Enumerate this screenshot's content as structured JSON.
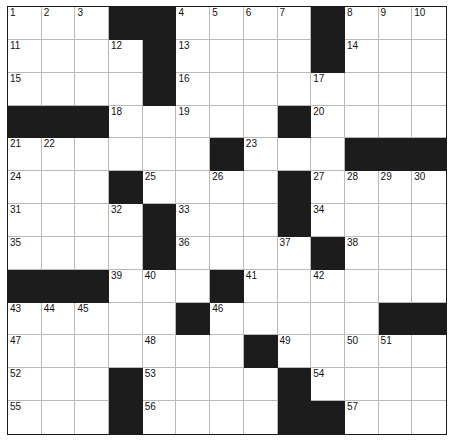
{
  "puzzle": {
    "kind": "crossword-grid",
    "title": "",
    "columns": 13,
    "rows": 13,
    "cell_colors": {
      "open": "#ffffff",
      "block": "#1c1c1c",
      "grid_line": "#b9b9b9",
      "outer_border": "#1a1a1a",
      "number_text": "#111111"
    },
    "clue_number_count": 57,
    "max_clue_number": 57,
    "grid": [
      [
        "1",
        "2",
        "3",
        "#",
        "#",
        "4",
        "5",
        "6",
        "7",
        "#",
        "8",
        "9",
        "10"
      ],
      [
        "11",
        "",
        "",
        "12",
        "#",
        "13",
        "",
        "",
        "",
        "#",
        "14",
        "",
        ""
      ],
      [
        "15",
        "",
        "",
        "",
        "#",
        "16",
        "",
        "",
        "",
        "17",
        "",
        "",
        ""
      ],
      [
        "#",
        "#",
        "#",
        "18",
        "",
        "19",
        "",
        "",
        "#",
        "20",
        "",
        "",
        ""
      ],
      [
        "21",
        "22",
        "",
        "",
        "",
        "",
        "#",
        "23",
        "",
        "",
        "#",
        "#",
        "#"
      ],
      [
        "24",
        "",
        "",
        "#",
        "25",
        "",
        "26",
        "",
        "#",
        "27",
        "28",
        "29",
        "30"
      ],
      [
        "31",
        "",
        "",
        "32",
        "#",
        "33",
        "",
        "",
        "#",
        "34",
        "",
        "",
        ""
      ],
      [
        "35",
        "",
        "",
        "",
        "#",
        "36",
        "",
        "",
        "37",
        "#",
        "38",
        "",
        ""
      ],
      [
        "#",
        "#",
        "#",
        "39",
        "40",
        "",
        "#",
        "41",
        "",
        "42",
        "",
        "",
        ""
      ],
      [
        "43",
        "44",
        "45",
        "",
        "",
        "#",
        "46",
        "",
        "",
        "",
        "",
        "#",
        "#"
      ],
      [
        "47",
        "",
        "",
        "",
        "48",
        "",
        "",
        "#",
        "49",
        "",
        "50",
        "51",
        ""
      ],
      [
        "52",
        "",
        "",
        "#",
        "53",
        "",
        "",
        "",
        "#",
        "54",
        "",
        "",
        ""
      ],
      [
        "55",
        "",
        "",
        "#",
        "56",
        "",
        "",
        "",
        "#",
        "#",
        "57",
        "",
        ""
      ]
    ],
    "numbers_in_reading_order": [
      "1",
      "2",
      "3",
      "4",
      "5",
      "6",
      "7",
      "8",
      "9",
      "10",
      "11",
      "12",
      "13",
      "14",
      "15",
      "16",
      "17",
      "18",
      "19",
      "20",
      "21",
      "22",
      "23",
      "24",
      "25",
      "26",
      "27",
      "28",
      "29",
      "30",
      "31",
      "32",
      "33",
      "34",
      "35",
      "36",
      "37",
      "38",
      "39",
      "40",
      "41",
      "42",
      "43",
      "44",
      "45",
      "46",
      "47",
      "48",
      "49",
      "50",
      "51",
      "52",
      "53",
      "54",
      "55",
      "56",
      "57"
    ],
    "block_cells": [
      [
        1,
        4
      ],
      [
        1,
        5
      ],
      [
        1,
        10
      ],
      [
        2,
        5
      ],
      [
        2,
        10
      ],
      [
        3,
        5
      ],
      [
        4,
        1
      ],
      [
        4,
        2
      ],
      [
        4,
        3
      ],
      [
        4,
        9
      ],
      [
        5,
        7
      ],
      [
        5,
        11
      ],
      [
        5,
        12
      ],
      [
        5,
        13
      ],
      [
        6,
        4
      ],
      [
        6,
        9
      ],
      [
        7,
        5
      ],
      [
        7,
        9
      ],
      [
        8,
        5
      ],
      [
        8,
        10
      ],
      [
        9,
        1
      ],
      [
        9,
        2
      ],
      [
        9,
        3
      ],
      [
        9,
        7
      ],
      [
        10,
        6
      ],
      [
        10,
        12
      ],
      [
        10,
        13
      ],
      [
        11,
        8
      ],
      [
        12,
        4
      ],
      [
        12,
        9
      ],
      [
        13,
        4
      ],
      [
        13,
        9
      ],
      [
        13,
        10
      ]
    ]
  }
}
